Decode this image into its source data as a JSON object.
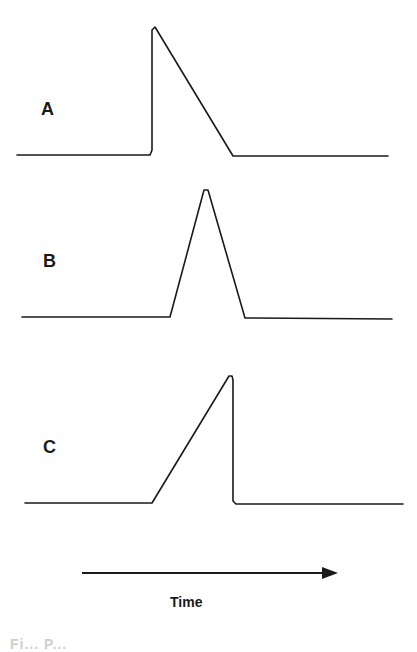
{
  "figure": {
    "panels": [
      {
        "label": "A",
        "shape": "instant rise, linear decay",
        "points": [
          [
            17,
            155
          ],
          [
            150,
            155
          ],
          [
            152,
            150
          ],
          [
            152,
            30
          ],
          [
            155,
            27
          ],
          [
            233,
            156
          ],
          [
            388,
            156
          ]
        ]
      },
      {
        "label": "B",
        "shape": "symmetric linear rise and decay",
        "points": [
          [
            22,
            317
          ],
          [
            170,
            317
          ],
          [
            204,
            190
          ],
          [
            208,
            190
          ],
          [
            245,
            318
          ],
          [
            392,
            319
          ]
        ]
      },
      {
        "label": "C",
        "shape": "linear rise, instant decay",
        "points": [
          [
            25,
            503
          ],
          [
            152,
            503
          ],
          [
            229,
            376
          ],
          [
            232,
            376
          ],
          [
            233,
            380
          ],
          [
            233,
            501
          ],
          [
            236,
            504
          ],
          [
            403,
            504
          ]
        ]
      }
    ],
    "time_axis": {
      "label": "Time",
      "arrow": {
        "x1": 82,
        "x2": 338,
        "y": 573
      }
    },
    "caption_partial": "Fi...  P..."
  },
  "colors": {
    "stroke": "#1a1a1a",
    "background": "#ffffff"
  }
}
